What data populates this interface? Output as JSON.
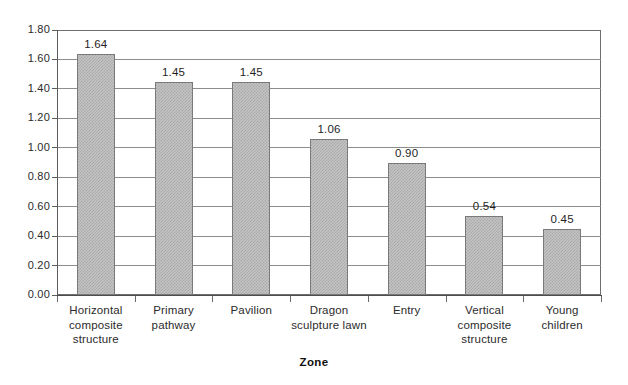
{
  "chart_data": {
    "type": "bar",
    "title": "",
    "subtitle": "",
    "xlabel": "Zone",
    "ylabel": "",
    "categories": [
      "Horizontal composite structure",
      "Primary pathway",
      "Pavilion",
      "Dragon sculpture lawn",
      "Entry",
      "Vertical composite structure",
      "Young children"
    ],
    "category_lines": [
      [
        "Horizontal",
        "composite",
        "structure"
      ],
      [
        "Primary",
        "pathway"
      ],
      [
        "Pavilion"
      ],
      [
        "Dragon",
        "sculpture lawn"
      ],
      [
        "Entry"
      ],
      [
        "Vertical",
        "composite",
        "structure"
      ],
      [
        "Young",
        "children"
      ]
    ],
    "values": [
      1.64,
      1.45,
      1.45,
      1.06,
      0.9,
      0.54,
      0.45
    ],
    "data_labels": [
      "1.64",
      "1.45",
      "1.45",
      "1.06",
      "0.90",
      "0.54",
      "0.45"
    ],
    "ylim": [
      0.0,
      1.8
    ],
    "ytick_values": [
      0.0,
      0.2,
      0.4,
      0.6,
      0.8,
      1.0,
      1.2,
      1.4,
      1.6,
      1.8
    ],
    "ytick_labels": [
      "0.00",
      "0.20",
      "0.40",
      "0.60",
      "0.80",
      "1.00",
      "1.20",
      "1.40",
      "1.60",
      "1.80"
    ],
    "grid": true,
    "legend": false,
    "legend_position": "none",
    "bar_fill": "#c3c3c3",
    "bar_pattern": "dither-checker",
    "bar_border": "#7a7a7a",
    "gridline_color": "#8d8d8d",
    "axis_color": "#5d5d5d",
    "text_color": "#2b2b2b"
  }
}
